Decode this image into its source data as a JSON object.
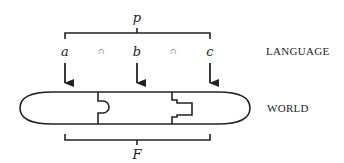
{
  "diagram": {
    "top_label": "p",
    "bottom_label": "F",
    "items": [
      {
        "label": "a"
      },
      {
        "label": "b"
      },
      {
        "label": "c"
      }
    ],
    "connector_symbol": "∩",
    "level_labels": {
      "language": "LANGUAGE",
      "world": "WORLD"
    },
    "colors": {
      "stroke": "#222222",
      "background": "#ffffff"
    }
  }
}
